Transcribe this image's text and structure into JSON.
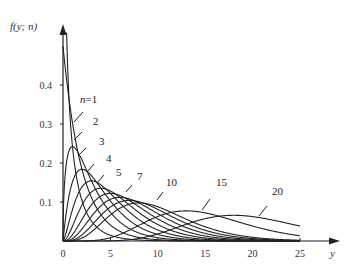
{
  "chart_data": {
    "type": "line",
    "title": "",
    "ylabel": "f(y; n)",
    "xlabel": "y",
    "xlim": [
      0,
      25
    ],
    "ylim": [
      0,
      0.5
    ],
    "x_ticks": [
      0,
      5,
      10,
      15,
      20,
      25
    ],
    "x_tick_labels": [
      "0",
      "5",
      "10",
      "15",
      "20",
      "25"
    ],
    "y_ticks": [
      0.1,
      0.2,
      0.3,
      0.4
    ],
    "y_tick_labels": [
      "0.1",
      "0.2",
      "0.3",
      "0.4"
    ],
    "grid": false,
    "legend": "inline labels with leader lines",
    "series": [
      {
        "name": "n=1",
        "n": 1,
        "label": "n=1",
        "labeled": true
      },
      {
        "name": "n=2",
        "n": 2,
        "label": "2",
        "labeled": true
      },
      {
        "name": "n=3",
        "n": 3,
        "label": "3",
        "labeled": true
      },
      {
        "name": "n=4",
        "n": 4,
        "label": "4",
        "labeled": true
      },
      {
        "name": "n=5",
        "n": 5,
        "label": "5",
        "labeled": true
      },
      {
        "name": "n=6",
        "n": 6,
        "label": "",
        "labeled": false
      },
      {
        "name": "n=7",
        "n": 7,
        "label": "7",
        "labeled": true
      },
      {
        "name": "n=8",
        "n": 8,
        "label": "",
        "labeled": false
      },
      {
        "name": "n=9",
        "n": 9,
        "label": "",
        "labeled": false
      },
      {
        "name": "n=10",
        "n": 10,
        "label": "10",
        "labeled": true
      },
      {
        "name": "n=15",
        "n": 15,
        "label": "15",
        "labeled": true
      },
      {
        "name": "n=20",
        "n": 20,
        "label": "20",
        "labeled": true
      }
    ],
    "peaks": [
      {
        "n": 2,
        "x": 0,
        "y": 0.5
      },
      {
        "n": 3,
        "x": 1,
        "y": 0.242
      },
      {
        "n": 4,
        "x": 2,
        "y": 0.184
      },
      {
        "n": 5,
        "x": 3,
        "y": 0.154
      },
      {
        "n": 7,
        "x": 5,
        "y": 0.122
      },
      {
        "n": 10,
        "x": 8,
        "y": 0.103
      },
      {
        "n": 15,
        "x": 13,
        "y": 0.079
      },
      {
        "n": 20,
        "x": 18,
        "y": 0.067
      }
    ],
    "colors": {
      "line": "#222222",
      "axis": "#222222",
      "background": "#ffffff"
    }
  },
  "labels": [
    {
      "text": "n=1",
      "x": 80,
      "y": 103,
      "leader": [
        [
          74,
          122
        ],
        [
          83,
          112
        ]
      ]
    },
    {
      "text": "2",
      "x": 93,
      "y": 125,
      "leader": [
        [
          74,
          140
        ],
        [
          82,
          132
        ]
      ]
    },
    {
      "text": "3",
      "x": 99,
      "y": 145,
      "leader": [
        [
          79,
          155
        ],
        [
          86,
          148
        ]
      ]
    },
    {
      "text": "4",
      "x": 106,
      "y": 162,
      "leader": [
        [
          87,
          172
        ],
        [
          94,
          164
        ]
      ]
    },
    {
      "text": "5",
      "x": 116,
      "y": 176,
      "leader": [
        [
          97,
          183
        ],
        [
          104,
          175
        ]
      ]
    },
    {
      "text": "7",
      "x": 137,
      "y": 180,
      "leader": [
        [
          126,
          192
        ],
        [
          132,
          185
        ]
      ]
    },
    {
      "text": "10",
      "x": 166,
      "y": 186,
      "leader": [
        [
          157,
          200
        ],
        [
          163,
          192
        ]
      ]
    },
    {
      "text": "15",
      "x": 216,
      "y": 186,
      "leader": [
        [
          202,
          210
        ],
        [
          210,
          199
        ]
      ]
    },
    {
      "text": "20",
      "x": 272,
      "y": 195,
      "leader": [
        [
          259,
          216
        ],
        [
          267,
          206
        ]
      ]
    }
  ],
  "axes": {
    "y_title": "f(y; n)",
    "x_title": "y"
  }
}
